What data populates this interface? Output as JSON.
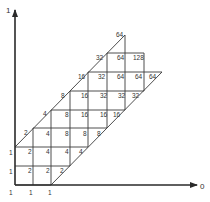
{
  "diagram": {
    "type": "lattice-grid",
    "axes": {
      "y_label": "1",
      "x_label": "0"
    },
    "geometry": {
      "origin": [
        15,
        185
      ],
      "y_axis_top": 10,
      "x_axis_right": 197,
      "h_lines": [
        {
          "y": 185,
          "x1": 15,
          "x2": 51
        },
        {
          "y": 166,
          "x1": 15,
          "x2": 70
        },
        {
          "y": 147,
          "x1": 15,
          "x2": 88
        },
        {
          "y": 128,
          "x1": 33,
          "x2": 107
        },
        {
          "y": 110,
          "x1": 51,
          "x2": 125
        },
        {
          "y": 91,
          "x1": 70,
          "x2": 144
        },
        {
          "y": 72,
          "x1": 88,
          "x2": 162
        },
        {
          "y": 53,
          "x1": 107,
          "x2": 144
        }
      ],
      "v_lines": [
        {
          "x": 33,
          "y1": 128,
          "y2": 185
        },
        {
          "x": 51,
          "y1": 110,
          "y2": 185
        },
        {
          "x": 70,
          "y1": 91,
          "y2": 166
        },
        {
          "x": 88,
          "y1": 72,
          "y2": 147
        },
        {
          "x": 107,
          "y1": 53,
          "y2": 128
        },
        {
          "x": 125,
          "y1": 35,
          "y2": 110
        },
        {
          "x": 144,
          "y1": 53,
          "y2": 91
        }
      ],
      "diagonals": [
        {
          "x1": 15,
          "y1": 147,
          "x2": 125,
          "y2": 35
        },
        {
          "x1": 51,
          "y1": 185,
          "x2": 162,
          "y2": 72
        }
      ]
    },
    "labels": [
      {
        "t": "1",
        "x": 9,
        "y": 195
      },
      {
        "t": "1",
        "x": 29,
        "y": 195
      },
      {
        "t": "1",
        "x": 48,
        "y": 195
      },
      {
        "t": "1",
        "x": 9,
        "y": 174
      },
      {
        "t": "2",
        "x": 28,
        "y": 173
      },
      {
        "t": "2",
        "x": 46,
        "y": 173
      },
      {
        "t": "2",
        "x": 60,
        "y": 173
      },
      {
        "t": "1",
        "x": 9,
        "y": 155
      },
      {
        "t": "2",
        "x": 28,
        "y": 154
      },
      {
        "t": "4",
        "x": 46,
        "y": 154
      },
      {
        "t": "4",
        "x": 65,
        "y": 154
      },
      {
        "t": "4",
        "x": 79,
        "y": 154
      },
      {
        "t": "2",
        "x": 24,
        "y": 135
      },
      {
        "t": "4",
        "x": 46,
        "y": 136
      },
      {
        "t": "8",
        "x": 65,
        "y": 136
      },
      {
        "t": "8",
        "x": 83,
        "y": 136
      },
      {
        "t": "8",
        "x": 97,
        "y": 136
      },
      {
        "t": "4",
        "x": 43,
        "y": 116
      },
      {
        "t": "8",
        "x": 65,
        "y": 117
      },
      {
        "t": "16",
        "x": 81,
        "y": 117
      },
      {
        "t": "16",
        "x": 100,
        "y": 117
      },
      {
        "t": "16",
        "x": 113,
        "y": 117
      },
      {
        "t": "8",
        "x": 61,
        "y": 98
      },
      {
        "t": "16",
        "x": 81,
        "y": 98
      },
      {
        "t": "32",
        "x": 100,
        "y": 98
      },
      {
        "t": "32",
        "x": 118,
        "y": 98
      },
      {
        "t": "32",
        "x": 132,
        "y": 98
      },
      {
        "t": "16",
        "x": 78,
        "y": 79
      },
      {
        "t": "32",
        "x": 98,
        "y": 79
      },
      {
        "t": "64",
        "x": 117,
        "y": 79
      },
      {
        "t": "64",
        "x": 135,
        "y": 79
      },
      {
        "t": "64",
        "x": 149,
        "y": 79
      },
      {
        "t": "32",
        "x": 96,
        "y": 60
      },
      {
        "t": "64",
        "x": 117,
        "y": 60
      },
      {
        "t": "128",
        "x": 133,
        "y": 60
      },
      {
        "t": "64",
        "x": 116,
        "y": 37
      }
    ],
    "colors": {
      "line": "#2a2a2a",
      "text": "#333333",
      "background": "#ffffff"
    }
  }
}
